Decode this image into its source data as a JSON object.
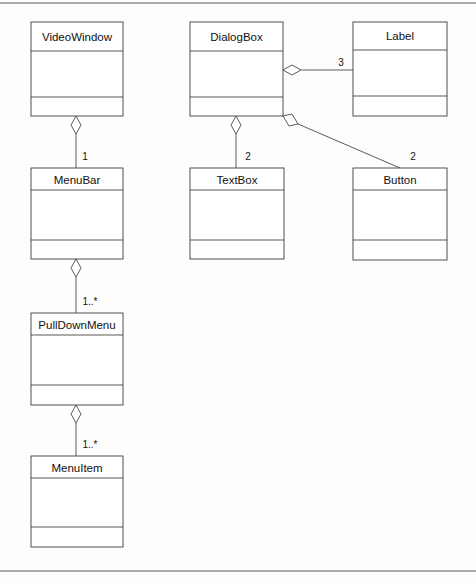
{
  "diagram": {
    "kind": "uml-class-diagram",
    "title": "",
    "page_background": "#fdfdfc",
    "line_color": "#3c3c3a",
    "text_color": "#111111",
    "frame": {
      "top_rule_y": 3,
      "bottom_rule_y": 571,
      "rule_color": "#5a5a58"
    },
    "classes": [
      {
        "id": "videowindow",
        "name": "VideoWindow",
        "x": 31,
        "y": 22,
        "width": 92,
        "height": 94,
        "divider1_y": 51,
        "divider2_y": 97,
        "attributes": [],
        "operations": []
      },
      {
        "id": "dialogbox",
        "name": "DialogBox",
        "x": 190,
        "y": 22,
        "width": 93,
        "height": 94,
        "divider1_y": 51,
        "divider2_y": 97,
        "attributes": [],
        "operations": []
      },
      {
        "id": "label",
        "name": "Label",
        "x": 353,
        "y": 22,
        "width": 94,
        "height": 94,
        "divider1_y": 50,
        "divider2_y": 96,
        "attributes": [],
        "operations": []
      },
      {
        "id": "menubar",
        "name": "MenuBar",
        "x": 31,
        "y": 168,
        "width": 92,
        "height": 91,
        "divider1_y": 190,
        "divider2_y": 240,
        "attributes": [],
        "operations": []
      },
      {
        "id": "textbox",
        "name": "TextBox",
        "x": 190,
        "y": 168,
        "width": 94,
        "height": 91,
        "divider1_y": 190,
        "divider2_y": 240,
        "attributes": [],
        "operations": []
      },
      {
        "id": "button",
        "name": "Button",
        "x": 353,
        "y": 168,
        "width": 94,
        "height": 92,
        "divider1_y": 190,
        "divider2_y": 240,
        "attributes": [],
        "operations": []
      },
      {
        "id": "pulldownmenu",
        "name": "PullDownMenu",
        "x": 31,
        "y": 313,
        "width": 92,
        "height": 92,
        "divider1_y": 335,
        "divider2_y": 385,
        "attributes": [],
        "operations": []
      },
      {
        "id": "menuitem",
        "name": "MenuItem",
        "x": 31,
        "y": 456,
        "width": 92,
        "height": 91,
        "divider1_y": 478,
        "divider2_y": 527,
        "attributes": [],
        "operations": []
      }
    ],
    "associations": [
      {
        "id": "videowindow-menubar",
        "type": "aggregation",
        "from": "videowindow",
        "to": "menubar",
        "multiplicity": "1",
        "multiplicity_x": 85,
        "multiplicity_y": 157,
        "diamond": {
          "cx": 76,
          "cy": 125,
          "rx": 5,
          "ry": 9,
          "orientation": "vertical"
        },
        "path": "M 76 134 L 76 168"
      },
      {
        "id": "menubar-pulldownmenu",
        "type": "aggregation",
        "from": "menubar",
        "to": "pulldownmenu",
        "multiplicity": "1..*",
        "multiplicity_x": 90,
        "multiplicity_y": 302,
        "diamond": {
          "cx": 76,
          "cy": 268,
          "rx": 5,
          "ry": 9,
          "orientation": "vertical"
        },
        "path": "M 76 277 L 76 313"
      },
      {
        "id": "pulldownmenu-menuitem",
        "type": "aggregation",
        "from": "pulldownmenu",
        "to": "menuitem",
        "multiplicity": "1..*",
        "multiplicity_x": 90,
        "multiplicity_y": 445,
        "diamond": {
          "cx": 76,
          "cy": 414,
          "rx": 5,
          "ry": 9,
          "orientation": "vertical"
        },
        "path": "M 76 423 L 76 456"
      },
      {
        "id": "dialogbox-textbox",
        "type": "aggregation",
        "from": "dialogbox",
        "to": "textbox",
        "multiplicity": "2",
        "multiplicity_x": 248,
        "multiplicity_y": 157,
        "diamond": {
          "cx": 236,
          "cy": 125,
          "rx": 5,
          "ry": 9,
          "orientation": "vertical"
        },
        "path": "M 236 134 L 236 168"
      },
      {
        "id": "dialogbox-label",
        "type": "aggregation",
        "from": "dialogbox",
        "to": "label",
        "multiplicity": "3",
        "multiplicity_x": 341,
        "multiplicity_y": 63,
        "diamond": {
          "cx": 292,
          "cy": 70,
          "rx": 9,
          "ry": 5,
          "orientation": "horizontal"
        },
        "path": "M 301 70 L 353 70"
      },
      {
        "id": "dialogbox-button",
        "type": "aggregation",
        "from": "dialogbox",
        "to": "button",
        "multiplicity": "2",
        "multiplicity_x": 413,
        "multiplicity_y": 157,
        "diamond": {
          "cx": 290,
          "cy": 121,
          "rx": 8,
          "ry": 5,
          "orientation": "diagonal",
          "rotation": 24
        },
        "path": "M 298 124 L 400 168"
      }
    ]
  }
}
